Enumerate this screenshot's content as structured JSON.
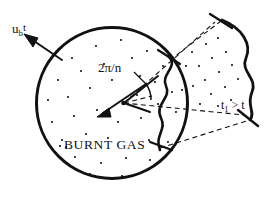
{
  "figure": {
    "background_color": "#ffffff",
    "ink_color": "#111111",
    "width": 280,
    "height": 200
  },
  "labels": {
    "burn_velocity": {
      "base": "u",
      "subscript": "b",
      "superscript": "t",
      "full": "u_b t"
    },
    "sector_angle": "2π/n",
    "region": "BURNT GAS",
    "later_time": {
      "base": "t",
      "subscript": "1",
      "relation": " > t",
      "full": "t1 > t"
    }
  },
  "geometry": {
    "circle": {
      "cx": 112,
      "cy": 103,
      "r": 75.5,
      "stroke_width": 3.0
    },
    "center_dot": {
      "cx": 123,
      "cy": 103,
      "r": 2.2
    },
    "speckle_count": 46,
    "sector_rays": [
      {
        "name": "ray-upper",
        "angle_deg": -52
      },
      {
        "name": "ray-lower",
        "angle_deg": 8
      }
    ],
    "flame_front_near": {
      "description": "wrinkled front on circle boundary"
    },
    "flame_front_far": {
      "description": "expanded wrinkled front at later time t1"
    }
  }
}
